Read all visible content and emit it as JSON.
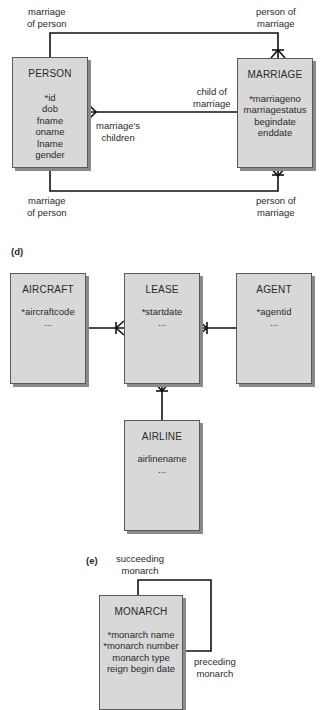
{
  "diagram_c": {
    "entities": {
      "person": {
        "name": "PERSON",
        "attributes": [
          "*id",
          "dob",
          "fname",
          "oname",
          "lname",
          "gender"
        ]
      },
      "marriage": {
        "name": "MARRIAGE",
        "attributes": [
          "*marriageno",
          "marriagestatus",
          "begindate",
          "enddate"
        ]
      }
    },
    "labels": {
      "top_left": [
        "marriage",
        "of person"
      ],
      "top_right": [
        "person of",
        "marriage"
      ],
      "mid_right": [
        "child of",
        "marriage"
      ],
      "mid_left": [
        "marriage's",
        "children"
      ],
      "bottom_left": [
        "marriage",
        "of person"
      ],
      "bottom_right": [
        "person of",
        "marriage"
      ]
    }
  },
  "diagram_d": {
    "part_label": "(d)",
    "entities": {
      "aircraft": {
        "name": "AIRCRAFT",
        "attributes": [
          "*aircraftcode",
          "..."
        ]
      },
      "lease": {
        "name": "LEASE",
        "attributes": [
          "*startdate",
          "..."
        ]
      },
      "agent": {
        "name": "AGENT",
        "attributes": [
          "*agentid",
          "..."
        ]
      },
      "airline": {
        "name": "AIRLINE",
        "attributes": [
          "airlinename",
          "..."
        ]
      }
    }
  },
  "diagram_e": {
    "part_label": "(e)",
    "entities": {
      "monarch": {
        "name": "MONARCH",
        "attributes": [
          "*monarch name",
          "*monarch number",
          "monarch type",
          "reign begin date"
        ]
      }
    },
    "labels": {
      "succeeding": [
        "succeeding",
        "monarch"
      ],
      "preceding": [
        "preceding",
        "monarch"
      ]
    }
  },
  "colors": {
    "entity_fill": "#d8d8d8",
    "entity_border": "#5a5a5a",
    "shadow": "#8a8a8a",
    "line": "#111111"
  }
}
